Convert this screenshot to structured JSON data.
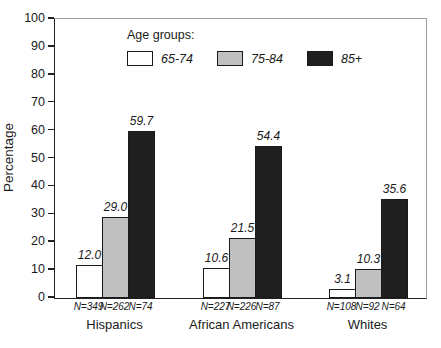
{
  "figure": {
    "background": "#ffffff",
    "text_color": "#1a1a1a",
    "frame_color": "#9e9e9e",
    "axis_color": "#222222"
  },
  "chart_data": {
    "type": "bar",
    "title": "",
    "xlabel": "",
    "ylabel": "Percentage",
    "ylim": [
      0,
      100
    ],
    "yticks": [
      0,
      10,
      20,
      30,
      40,
      50,
      60,
      70,
      80,
      90,
      100
    ],
    "grid": false,
    "legend_position": "top-inside",
    "legend": {
      "title": "Age groups:"
    },
    "categories": [
      "Hispanics",
      "African Americans",
      "Whites"
    ],
    "series": [
      {
        "name": "65-74",
        "color": "#ffffff",
        "values": [
          12.0,
          10.6,
          3.1
        ],
        "n_labels": [
          "N=349",
          "N=227",
          "N=108"
        ]
      },
      {
        "name": "75-84",
        "color": "#c0c0c0",
        "values": [
          29.0,
          21.5,
          10.3
        ],
        "n_labels": [
          "N=262",
          "N=226",
          "N=92"
        ]
      },
      {
        "name": "85+",
        "color": "#1f1f1f",
        "values": [
          59.7,
          54.4,
          35.6
        ],
        "n_labels": [
          "N=74",
          "N=87",
          "N=64"
        ]
      }
    ],
    "value_label_decimals": 1
  }
}
